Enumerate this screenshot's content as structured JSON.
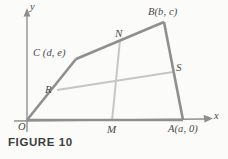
{
  "figure": {
    "caption": "FIGURE 10",
    "axes": {
      "x_label": "x",
      "y_label": "y",
      "origin_label": "O"
    },
    "colors": {
      "outline": "#8a8a8a",
      "inner_line": "#c2c2c2",
      "axis": "#909090",
      "text": "#4a4a4a",
      "background": "#fbfbf9"
    },
    "vertices": [
      {
        "name": "O",
        "label": "O",
        "x": 27,
        "y": 121
      },
      {
        "name": "A",
        "label": "A(a, 0)",
        "x": 183,
        "y": 121
      },
      {
        "name": "B",
        "label": "B(b, c)",
        "x": 164,
        "y": 22
      },
      {
        "name": "C",
        "label": "C (d, e)",
        "x": 76,
        "y": 59
      }
    ],
    "midpoints": [
      {
        "name": "M",
        "label": "M",
        "x": 112,
        "y": 121
      },
      {
        "name": "N",
        "label": "N",
        "x": 120,
        "y": 40
      },
      {
        "name": "R",
        "label": "R",
        "x": 57,
        "y": 90
      },
      {
        "name": "S",
        "label": "S",
        "x": 173,
        "y": 72
      }
    ],
    "segments": [
      {
        "name": "side-OA",
        "from": "O",
        "to": "A",
        "style": "outline"
      },
      {
        "name": "side-AB",
        "from": "A",
        "to": "B",
        "style": "outline"
      },
      {
        "name": "side-BC",
        "from": "B",
        "to": "C",
        "style": "outline"
      },
      {
        "name": "side-CO",
        "from": "C",
        "to": "O",
        "style": "outline"
      },
      {
        "name": "median-MN",
        "from": "M",
        "to": "N",
        "style": "inner"
      },
      {
        "name": "median-RS",
        "from": "R",
        "to": "S",
        "style": "inner"
      }
    ]
  }
}
